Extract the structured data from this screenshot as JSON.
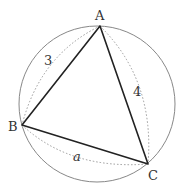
{
  "diagram": {
    "circle": {
      "cx": 97,
      "cy": 104,
      "r": 78
    },
    "vertices": {
      "A": {
        "label": "A",
        "x": 100,
        "y": 26
      },
      "B": {
        "label": "B",
        "x": 22,
        "y": 125
      },
      "C": {
        "label": "C",
        "x": 148,
        "y": 164
      }
    },
    "sides": {
      "AB": {
        "label": "3"
      },
      "AC": {
        "label": "4"
      },
      "BC": {
        "label": "a"
      }
    },
    "colors": {
      "circle": "#888888",
      "triangle": "#222222",
      "dotted": "#999999",
      "text": "#333333"
    }
  }
}
